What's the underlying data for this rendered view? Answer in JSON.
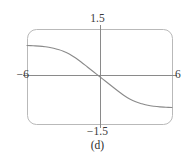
{
  "figure": {
    "caption": "(d)",
    "frame": {
      "x0": 27,
      "y0": 29,
      "x1": 172,
      "y1": 124,
      "corner_radius": 9,
      "stroke": "#b9b9b9",
      "stroke_width": 1
    },
    "axes": {
      "origin_x": 100,
      "origin_y": 75,
      "stroke": "#8a8a8a",
      "stroke_width": 1,
      "x_axis_from": 23,
      "x_axis_to": 177,
      "y_axis_from": 25,
      "y_axis_to": 128
    },
    "labels": {
      "top": "1.5",
      "bottom": "−1.5",
      "left": "−6",
      "right": "6"
    }
  },
  "chart_data": {
    "type": "line",
    "title": "",
    "subtitle": "",
    "xlabel": "",
    "ylabel": "",
    "xlim": [
      -6,
      6
    ],
    "ylim": [
      -1.5,
      1.5
    ],
    "xticks": [
      -6,
      6
    ],
    "xticklabels": [
      "−6",
      "6"
    ],
    "yticks": [
      -1.5,
      1.5
    ],
    "yticklabels": [
      "−1.5",
      "1.5"
    ],
    "grid": false,
    "legend": null,
    "annotations": [
      "(d)"
    ],
    "series": [
      {
        "name": "decreasing sigmoid",
        "description": "monotonically decreasing S-curve through the origin, asymptotically flat near y = +0.98 on the left and y = -0.98 on the right",
        "color": "#8a8a8a",
        "stroke_width": 1.1,
        "x": [
          -6.0,
          -5.5,
          -5.0,
          -4.5,
          -4.0,
          -3.5,
          -3.0,
          -2.5,
          -2.0,
          -1.5,
          -1.0,
          -0.5,
          0.0,
          0.5,
          1.0,
          1.5,
          2.0,
          2.5,
          3.0,
          3.5,
          4.0,
          4.5,
          5.0,
          5.5,
          6.0
        ],
        "y": [
          0.98,
          0.97,
          0.96,
          0.94,
          0.91,
          0.86,
          0.8,
          0.71,
          0.59,
          0.45,
          0.3,
          0.15,
          0.0,
          -0.15,
          -0.3,
          -0.45,
          -0.59,
          -0.71,
          -0.8,
          -0.86,
          -0.91,
          -0.94,
          -0.96,
          -0.97,
          -0.98
        ]
      }
    ]
  }
}
